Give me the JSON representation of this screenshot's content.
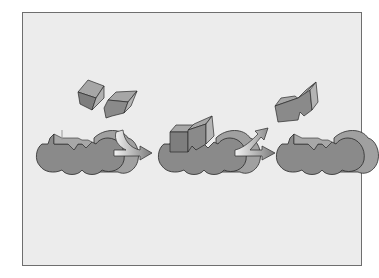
{
  "diagram": {
    "type": "enzyme-substrate reaction (lock and key model)",
    "stages": [
      {
        "id": "stage-1",
        "description": "enzyme with empty active site and two free substrates"
      },
      {
        "id": "stage-2",
        "description": "enzyme-substrate complex"
      },
      {
        "id": "stage-3",
        "description": "enzyme released and joined product"
      }
    ],
    "colors": {
      "background": "#ececec",
      "border": "#6e6e6e",
      "enzyme_fill": "#8a8a8a",
      "enzyme_side": "#a0a0a0",
      "outline": "#2a2a2a",
      "substrate_face": "#8c8c8c",
      "substrate_top": "#a6a6a6",
      "substrate_side": "#b4b4b4",
      "arrow_light": "#f4f4f4",
      "arrow_dark": "#7a7a7a"
    },
    "arrows": [
      {
        "id": "arrow-bind",
        "from": "stage-1",
        "to": "stage-2",
        "kind": "merge"
      },
      {
        "id": "arrow-release",
        "from": "stage-2",
        "to": "stage-3",
        "kind": "split"
      }
    ]
  }
}
